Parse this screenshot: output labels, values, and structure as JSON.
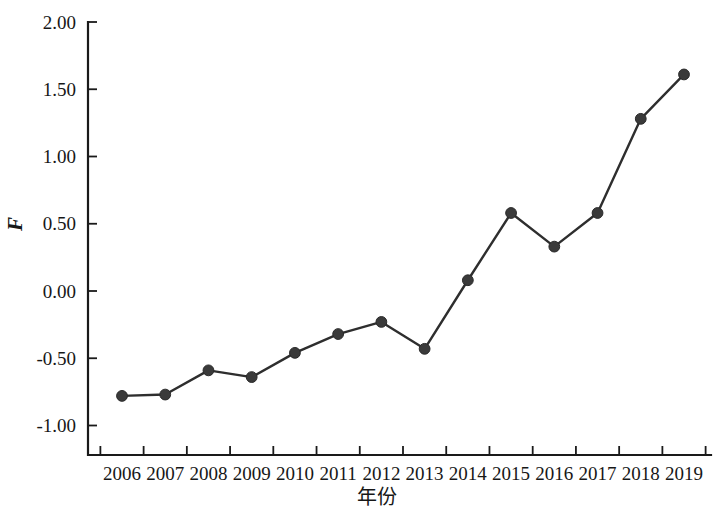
{
  "chart_data": {
    "type": "line",
    "title": "",
    "subtitle": "",
    "xlabel": "年份",
    "ylabel": "F",
    "categories": [
      "2006",
      "2007",
      "2008",
      "2009",
      "2010",
      "2011",
      "2012",
      "2013",
      "2014",
      "2015",
      "2016",
      "2017",
      "2018",
      "2019"
    ],
    "x": [
      2006,
      2007,
      2008,
      2009,
      2010,
      2011,
      2012,
      2013,
      2014,
      2015,
      2016,
      2017,
      2018,
      2019
    ],
    "values": [
      -0.78,
      -0.77,
      -0.59,
      -0.64,
      -0.46,
      -0.32,
      -0.23,
      -0.43,
      0.08,
      0.58,
      0.33,
      0.58,
      1.28,
      1.61
    ],
    "series": [
      {
        "name": "F",
        "values": [
          -0.78,
          -0.77,
          -0.59,
          -0.64,
          -0.46,
          -0.32,
          -0.23,
          -0.43,
          0.08,
          0.58,
          0.33,
          0.58,
          1.28,
          1.61
        ]
      }
    ],
    "ylim": [
      -1.0,
      2.0
    ],
    "ytick_labels": [
      "2.00",
      "1.50",
      "1.00",
      "0.50",
      "0.00",
      "-0.50",
      "-1.00"
    ],
    "ytick_values": [
      2.0,
      1.5,
      1.0,
      0.5,
      0.0,
      -0.5,
      -1.0
    ],
    "xtick_labels": [
      "2006",
      "2007",
      "2008",
      "2009",
      "2010",
      "2011",
      "2012",
      "2013",
      "2014",
      "2015",
      "2016",
      "2017",
      "2018",
      "2019"
    ],
    "grid": false,
    "legend": false,
    "legend_position": "none",
    "marker": "filled-circle",
    "line_color": "#2e2e2e",
    "marker_color": "#3a3a3a",
    "background_color": "#ffffff"
  },
  "axis": {
    "y_label": "F",
    "x_label": "年份"
  }
}
